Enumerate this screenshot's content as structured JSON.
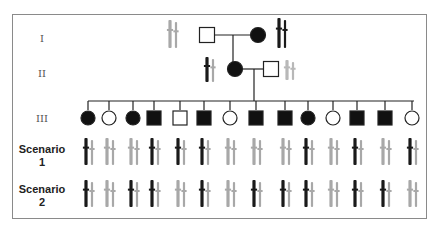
{
  "labels": {
    "gen1": "I",
    "gen2": "II",
    "gen3": "III",
    "scenario1_line1": "Scenario",
    "scenario1_line2": "1",
    "scenario2_line1": "Scenario",
    "scenario2_line2": "2"
  },
  "colors": {
    "affected": "#111111",
    "unaffected_fill": "#ffffff",
    "line": "#222222",
    "chrom_dark": "#1a1a1a",
    "chrom_gray": "#a8a8a8",
    "chrom_light": "#b8b8b8",
    "frame": "#8a8a8a"
  },
  "generation_I": [
    {
      "sex": "male",
      "affected": false,
      "chromosomes": [
        "gray",
        "gray"
      ]
    },
    {
      "sex": "female",
      "affected": true,
      "chromosomes": [
        "dark",
        "dark"
      ]
    }
  ],
  "generation_II": [
    {
      "sex": "female",
      "affected": true,
      "chromosomes": [
        "dark",
        "gray"
      ]
    },
    {
      "sex": "male",
      "affected": false,
      "spouse": true,
      "chromosomes": [
        "light",
        "light"
      ]
    }
  ],
  "generation_III": [
    {
      "sex": "female",
      "affected": true,
      "scenario1": "dark",
      "scenario2": "dark"
    },
    {
      "sex": "female",
      "affected": false,
      "scenario1": "gray",
      "scenario2": "gray"
    },
    {
      "sex": "female",
      "affected": true,
      "scenario1": "gray",
      "scenario2": "dark"
    },
    {
      "sex": "male",
      "affected": true,
      "scenario1": "dark",
      "scenario2": "dark"
    },
    {
      "sex": "male",
      "affected": false,
      "scenario1": "dark",
      "scenario2": "gray"
    },
    {
      "sex": "male",
      "affected": true,
      "scenario1": "dark",
      "scenario2": "dark"
    },
    {
      "sex": "female",
      "affected": false,
      "scenario1": "gray",
      "scenario2": "gray"
    },
    {
      "sex": "male",
      "affected": true,
      "scenario1": "gray",
      "scenario2": "dark"
    },
    {
      "sex": "male",
      "affected": true,
      "scenario1": "gray",
      "scenario2": "dark"
    },
    {
      "sex": "female",
      "affected": true,
      "scenario1": "dark",
      "scenario2": "dark"
    },
    {
      "sex": "female",
      "affected": false,
      "scenario1": "gray",
      "scenario2": "gray"
    },
    {
      "sex": "male",
      "affected": true,
      "scenario1": "dark",
      "scenario2": "dark"
    },
    {
      "sex": "male",
      "affected": true,
      "scenario1": "gray",
      "scenario2": "dark"
    },
    {
      "sex": "female",
      "affected": false,
      "scenario1": "dark",
      "scenario2": "gray"
    }
  ]
}
